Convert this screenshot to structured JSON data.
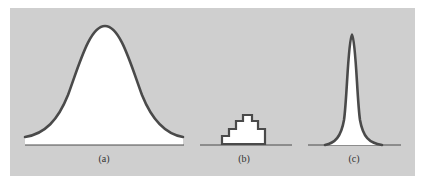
{
  "figure": {
    "background_color": "#cfcfcf",
    "curve_color": "#4a4a4a",
    "fill_color": "#ffffff",
    "panels": [
      {
        "id": "a",
        "label": "(a)",
        "shape": "wide bell curve"
      },
      {
        "id": "b",
        "label": "(b)",
        "shape": "small stepped histogram"
      },
      {
        "id": "c",
        "label": "(c)",
        "shape": "narrow sharp peak"
      }
    ]
  }
}
